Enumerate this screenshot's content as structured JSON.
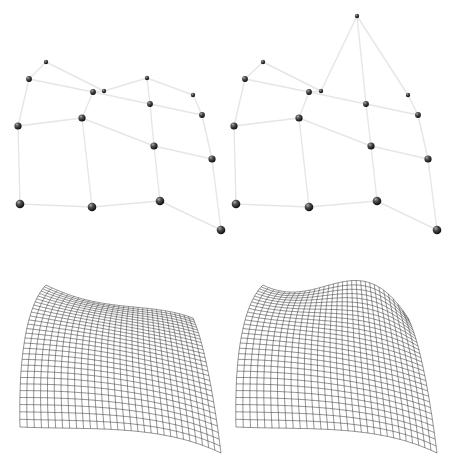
{
  "figure": {
    "panels": [
      {
        "id": "control-net-original",
        "points": [
          [
            [
              46,
              62
            ],
            [
              104,
              91
            ],
            [
              147,
              78
            ],
            [
              193,
              95
            ]
          ],
          [
            [
              29,
              79
            ],
            [
              93,
              92
            ],
            [
              150,
              104
            ],
            [
              202,
              115
            ]
          ],
          [
            [
              18,
              126
            ],
            [
              82,
              118
            ],
            [
              154,
              146
            ],
            [
              212,
              159
            ]
          ],
          [
            [
              20,
              204
            ],
            [
              92,
              207
            ],
            [
              160,
              201
            ],
            [
              221,
              230
            ]
          ]
        ]
      },
      {
        "id": "control-net-modified",
        "points": [
          [
            [
              263,
              62
            ],
            [
              321,
              91
            ],
            [
              357,
              16
            ],
            [
              408,
              95
            ]
          ],
          [
            [
              245,
              79
            ],
            [
              309,
              92
            ],
            [
              366,
              104
            ],
            [
              418,
              115
            ]
          ],
          [
            [
              234,
              126
            ],
            [
              299,
              118
            ],
            [
              371,
              146
            ],
            [
              428,
              159
            ]
          ],
          [
            [
              236,
              204
            ],
            [
              309,
              207
            ],
            [
              377,
              201
            ],
            [
              437,
              230
            ]
          ]
        ]
      }
    ],
    "surfaces": [
      {
        "id": "surface-original",
        "source_panel": 0,
        "offset_y": 223,
        "grid": 30
      },
      {
        "id": "surface-modified",
        "source_panel": 1,
        "offset_y": 223,
        "grid": 30
      }
    ],
    "colors": {
      "edge": "#e6e6e6",
      "mesh": "#3a3a3a",
      "sphere_dark": "#111111",
      "sphere_light": "#9a9a9a"
    }
  }
}
